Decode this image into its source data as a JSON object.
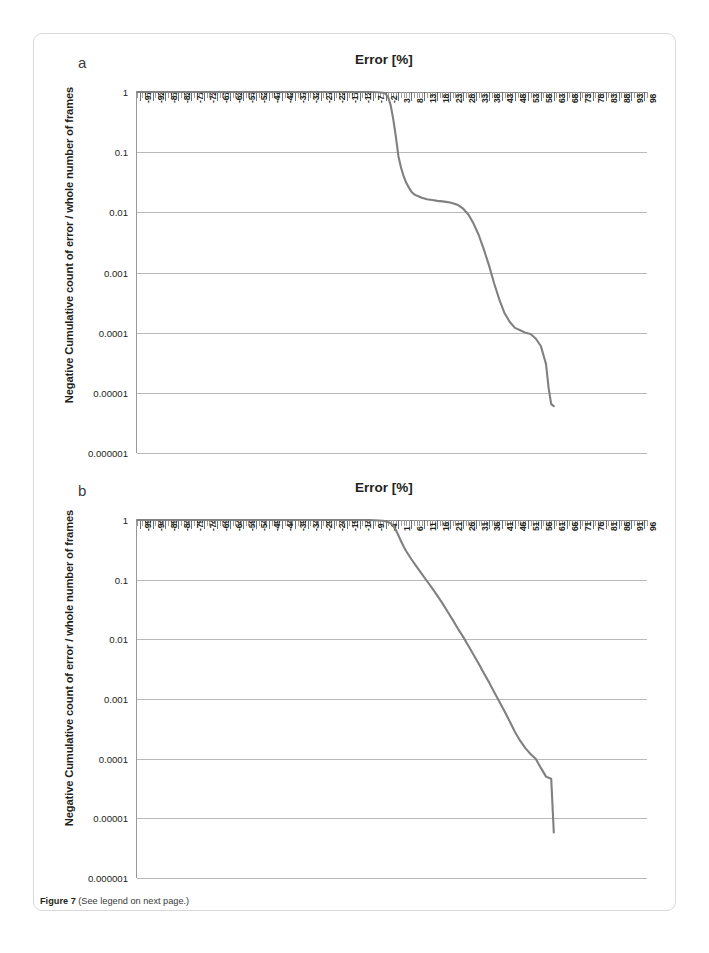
{
  "figure": {
    "caption_label": "Figure 7",
    "caption_text": "(See legend on next page.)"
  },
  "panels": [
    {
      "letter": "a"
    },
    {
      "letter": "b"
    }
  ],
  "chart_data": [
    {
      "type": "line",
      "panel": "a",
      "title": "Error [%]",
      "xlabel": "",
      "ylabel": "Negative Cumulative count of error / whole number of frames",
      "yscale": "log",
      "ylim": [
        1e-06,
        1
      ],
      "ytick_labels": [
        "1",
        "0.1",
        "0.01",
        "0.001",
        "0.0001",
        "0.00001",
        "0.000001"
      ],
      "ytick_values": [
        1,
        0.1,
        0.01,
        0.001,
        0.0001,
        1e-05,
        1e-06
      ],
      "xlim": [
        -98,
        99
      ],
      "xtick_labels": [
        "-97",
        "-92",
        "-87",
        "-82",
        "-77",
        "-72",
        "-67",
        "-62",
        "-57",
        "-52",
        "-47",
        "-42",
        "-37",
        "-32",
        "-27",
        "-22",
        "-17",
        "-12",
        "-7",
        "-2",
        "3",
        "8",
        "13",
        "18",
        "23",
        "28",
        "33",
        "38",
        "43",
        "48",
        "53",
        "58",
        "63",
        "68",
        "73",
        "78",
        "83",
        "88",
        "93",
        "98"
      ],
      "xtick_values": [
        -97,
        -92,
        -87,
        -82,
        -77,
        -72,
        -67,
        -62,
        -57,
        -52,
        -47,
        -42,
        -37,
        -32,
        -27,
        -22,
        -17,
        -12,
        -7,
        -2,
        3,
        8,
        13,
        18,
        23,
        28,
        33,
        38,
        43,
        48,
        53,
        58,
        63,
        68,
        73,
        78,
        83,
        88,
        93,
        98
      ],
      "grid": true,
      "legend": "none",
      "series": [
        {
          "name": "negative cumulative error fraction",
          "color": "#808080",
          "x": [
            -98,
            -90,
            -80,
            -70,
            -60,
            -50,
            -40,
            -30,
            -20,
            -12,
            -8,
            -5,
            -3,
            -2,
            -1,
            0,
            1,
            2,
            3,
            4,
            5,
            6,
            7,
            8,
            9,
            10,
            12,
            14,
            16,
            18,
            20,
            22,
            24,
            26,
            28,
            30,
            32,
            34,
            36,
            38,
            40,
            42,
            44,
            46,
            48,
            50,
            52,
            54,
            56,
            58,
            60,
            61,
            62,
            63
          ],
          "y": [
            1,
            1,
            1,
            1,
            1,
            1,
            1,
            1,
            1,
            1,
            1,
            0.99,
            0.97,
            0.93,
            0.82,
            0.6,
            0.35,
            0.18,
            0.085,
            0.055,
            0.04,
            0.031,
            0.026,
            0.022,
            0.02,
            0.019,
            0.0175,
            0.0165,
            0.016,
            0.0155,
            0.0152,
            0.0148,
            0.0142,
            0.0132,
            0.0115,
            0.0092,
            0.0065,
            0.0042,
            0.0024,
            0.0013,
            0.00065,
            0.00035,
            0.00021,
            0.00015,
            0.00012,
            0.00011,
            0.0001,
            9.5e-05,
            8e-05,
            6e-05,
            3e-05,
            1.2e-05,
            6.5e-06,
            6e-06
          ]
        }
      ]
    },
    {
      "type": "line",
      "panel": "b",
      "title": "Error [%]",
      "xlabel": "",
      "ylabel": "Negative Cumulative count of error / whole number of frames",
      "yscale": "log",
      "ylim": [
        1e-06,
        1
      ],
      "ytick_labels": [
        "1",
        "0.1",
        "0.01",
        "0.001",
        "0.0001",
        "0.00001",
        "0.000001"
      ],
      "ytick_values": [
        1,
        0.1,
        0.01,
        0.001,
        0.0001,
        1e-05,
        1e-06
      ],
      "xlim": [
        -100,
        97
      ],
      "xtick_labels": [
        "-99",
        "-94",
        "-89",
        "-84",
        "-79",
        "-74",
        "-69",
        "-64",
        "-59",
        "-54",
        "-49",
        "-44",
        "-39",
        "-34",
        "-29",
        "-24",
        "-19",
        "-14",
        "-9",
        "-4",
        "1",
        "6",
        "11",
        "16",
        "21",
        "26",
        "31",
        "36",
        "41",
        "46",
        "51",
        "56",
        "61",
        "66",
        "71",
        "76",
        "81",
        "86",
        "91",
        "96"
      ],
      "xtick_values": [
        -99,
        -94,
        -89,
        -84,
        -79,
        -74,
        -69,
        -64,
        -59,
        -54,
        -49,
        -44,
        -39,
        -34,
        -29,
        -24,
        -19,
        -14,
        -9,
        -4,
        1,
        6,
        11,
        16,
        21,
        26,
        31,
        36,
        41,
        46,
        51,
        56,
        61,
        66,
        71,
        76,
        81,
        86,
        91,
        96
      ],
      "grid": true,
      "legend": "none",
      "series": [
        {
          "name": "negative cumulative error fraction",
          "color": "#808080",
          "x": [
            -100,
            -90,
            -80,
            -70,
            -60,
            -50,
            -40,
            -30,
            -20,
            -12,
            -8,
            -5,
            -3,
            -2,
            -1,
            0,
            1,
            2,
            3,
            4,
            6,
            8,
            10,
            12,
            14,
            16,
            18,
            20,
            22,
            24,
            26,
            28,
            30,
            32,
            34,
            36,
            38,
            40,
            42,
            44,
            46,
            48,
            50,
            52,
            54,
            56,
            58,
            59,
            60,
            61
          ],
          "y": [
            1,
            1,
            1,
            1,
            1,
            1,
            1,
            1,
            1,
            1,
            0.99,
            0.97,
            0.93,
            0.88,
            0.8,
            0.68,
            0.55,
            0.44,
            0.36,
            0.3,
            0.22,
            0.165,
            0.125,
            0.095,
            0.072,
            0.054,
            0.04,
            0.029,
            0.021,
            0.015,
            0.011,
            0.0078,
            0.0055,
            0.0039,
            0.0027,
            0.0019,
            0.0013,
            0.0009,
            0.00062,
            0.00042,
            0.00028,
            0.0002,
            0.00015,
            0.00012,
            0.0001,
            7e-05,
            5e-05,
            4.8e-05,
            4.6e-05,
            5.8e-06
          ]
        }
      ]
    }
  ]
}
